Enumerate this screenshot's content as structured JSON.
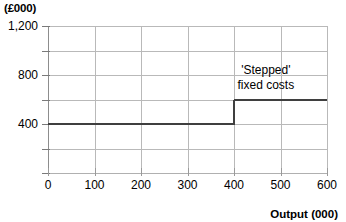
{
  "chart_data": {
    "type": "line",
    "title": "",
    "subtitle": "",
    "xlabel": "Output (000)",
    "ylabel": "(£000)",
    "xlim": [
      0,
      600
    ],
    "ylim": [
      0,
      1200
    ],
    "grid": true,
    "legend": "none",
    "x_ticks": [
      0,
      100,
      200,
      300,
      400,
      500,
      600
    ],
    "x_tick_labels": [
      "0",
      "100",
      "200",
      "300",
      "400",
      "500",
      "600"
    ],
    "y_ticks": [
      0,
      200,
      400,
      600,
      800,
      1000,
      1200
    ],
    "y_tick_labels": [
      "",
      "",
      "400",
      "",
      "800",
      "",
      "1,200"
    ],
    "y_gridlines": [
      200,
      400,
      600,
      800,
      1000,
      1200
    ],
    "series": [
      {
        "name": "'Stepped' fixed costs",
        "step": "post",
        "x": [
          0,
          400,
          400,
          600
        ],
        "y": [
          400,
          400,
          600,
          600
        ],
        "color": "#3f3f3f"
      }
    ],
    "annotations": [
      {
        "name": "stepped-fixed-costs-label",
        "lines": [
          "'Stepped'",
          "fixed costs"
        ],
        "x": 500,
        "y": 800
      }
    ]
  },
  "axes": {
    "y_unit_label": "(£000)",
    "x_title": "Output (000)",
    "y_labels": [
      {
        "value": 1200,
        "text": "1,200"
      },
      {
        "value": 800,
        "text": "800"
      },
      {
        "value": 400,
        "text": "400"
      }
    ],
    "x_labels": [
      {
        "value": 0,
        "text": "0"
      },
      {
        "value": 100,
        "text": "100"
      },
      {
        "value": 200,
        "text": "200"
      },
      {
        "value": 300,
        "text": "300"
      },
      {
        "value": 400,
        "text": "400"
      },
      {
        "value": 500,
        "text": "500"
      },
      {
        "value": 600,
        "text": "600"
      }
    ]
  },
  "annotation": {
    "line1": "'Stepped'",
    "line2": "fixed costs"
  },
  "colors": {
    "series": "#3f3f3f",
    "grid": "#b9b9b9",
    "axis": "#8d8d8d",
    "background": "#ffffff"
  }
}
